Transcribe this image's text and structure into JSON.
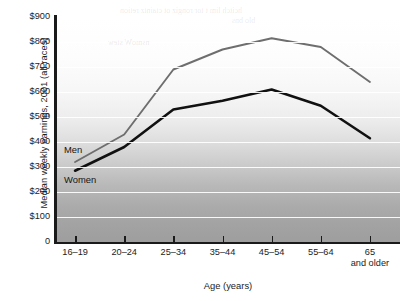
{
  "chart_data": {
    "type": "line",
    "title": "",
    "xlabel": "Age (years)",
    "ylabel": "Median weekly earnings, 2001 (all races)",
    "categories": [
      "16–19",
      "20–24",
      "25–34",
      "35–44",
      "45–54",
      "55–64",
      "65 and older"
    ],
    "category_labels": [
      {
        "line1": "16–19",
        "line2": ""
      },
      {
        "line1": "20–24",
        "line2": ""
      },
      {
        "line1": "25–34",
        "line2": ""
      },
      {
        "line1": "35–44",
        "line2": ""
      },
      {
        "line1": "45–54",
        "line2": ""
      },
      {
        "line1": "55–64",
        "line2": ""
      },
      {
        "line1": "65",
        "line2": "and older"
      }
    ],
    "series": [
      {
        "name": "Men",
        "color": "#6e6e6e",
        "values": [
          320,
          430,
          690,
          770,
          815,
          780,
          640
        ]
      },
      {
        "name": "Women",
        "color": "#111111",
        "values": [
          285,
          380,
          530,
          565,
          610,
          545,
          415
        ]
      }
    ],
    "ylim": [
      0,
      900
    ],
    "ytick_values": [
      0,
      100,
      200,
      300,
      400,
      500,
      600,
      700,
      800,
      900
    ],
    "ytick_labels": [
      "0",
      "$100",
      "$200",
      "$300",
      "$400",
      "$500",
      "$600",
      "$700",
      "$800",
      "$900"
    ],
    "grid": true,
    "grid_color": "#ffffff",
    "legend_position": "inline-annotations",
    "plot_background": "vertical-gradient-white-to-gray"
  },
  "annotations": {
    "men_label": "Men",
    "women_label": "Women"
  },
  "bleedthrough": {
    "line1": "hcitch lim t tor rongiz ot ctaintz retion",
    "line2": "blo bns",
    "line3": "nsmoW stew"
  }
}
